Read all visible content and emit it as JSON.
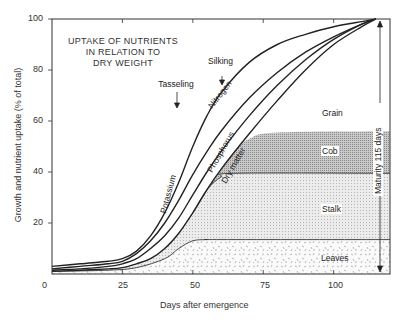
{
  "chart_data": {
    "type": "line",
    "title": "UPTAKE OF NUTRIENTS IN RELATION TO DRY WEIGHT",
    "title_lines": [
      "UPTAKE OF NUTRIENTS",
      "IN RELATION TO",
      "DRY WEIGHT"
    ],
    "xlabel": "Days after emergence",
    "ylabel": "Growth and nutrient uptake (% of total)",
    "xlim": [
      0,
      120
    ],
    "ylim": [
      0,
      100
    ],
    "x_ticks": [
      0,
      25,
      50,
      75,
      100
    ],
    "y_ticks": [
      20,
      40,
      60,
      80,
      100
    ],
    "grid": false,
    "series": [
      {
        "name": "Potassium",
        "x": [
          0,
          10,
          20,
          25,
          30,
          35,
          40,
          45,
          50,
          55,
          60,
          70,
          80,
          90,
          100,
          110,
          115
        ],
        "values": [
          3,
          4,
          5,
          6,
          9,
          15,
          24,
          36,
          50,
          62,
          71,
          83,
          90,
          94,
          97,
          99,
          100
        ]
      },
      {
        "name": "Nitrogen",
        "x": [
          0,
          10,
          20,
          25,
          30,
          35,
          40,
          45,
          50,
          55,
          60,
          70,
          80,
          90,
          100,
          110,
          115
        ],
        "values": [
          2,
          3,
          4,
          5,
          8,
          13,
          20,
          29,
          39,
          48,
          56,
          69,
          79,
          87,
          93,
          98,
          100
        ]
      },
      {
        "name": "Phosphorus",
        "x": [
          0,
          10,
          20,
          25,
          30,
          35,
          40,
          45,
          50,
          55,
          60,
          70,
          80,
          90,
          100,
          110,
          115
        ],
        "values": [
          1.5,
          2,
          3,
          4,
          6,
          10,
          15,
          22,
          31,
          40,
          48,
          62,
          74,
          84,
          92,
          98,
          100
        ]
      },
      {
        "name": "Dry matter",
        "x": [
          0,
          10,
          20,
          25,
          30,
          35,
          40,
          45,
          50,
          55,
          60,
          70,
          80,
          90,
          100,
          110,
          115
        ],
        "values": [
          1,
          1.5,
          2,
          2.5,
          4,
          6,
          10,
          16,
          24,
          33,
          41,
          55,
          68,
          80,
          90,
          97,
          100
        ]
      }
    ],
    "stacked_areas": [
      {
        "name": "Leaves",
        "x": [
          0,
          20,
          30,
          40,
          45,
          50,
          55,
          60,
          120
        ],
        "top": [
          1,
          1.5,
          2.5,
          6,
          10,
          13,
          13.5,
          13.5,
          13.5
        ]
      },
      {
        "name": "Stalk",
        "x": [
          0,
          20,
          30,
          40,
          45,
          50,
          55,
          60,
          65,
          120
        ],
        "top": [
          1,
          2,
          4,
          10,
          16,
          24,
          33,
          38,
          39.5,
          39.5
        ]
      },
      {
        "name": "Cob",
        "x": [
          50,
          55,
          60,
          65,
          70,
          80,
          120
        ],
        "top": [
          24,
          33,
          41,
          48,
          53,
          55.5,
          56
        ]
      },
      {
        "name": "Grain",
        "x": [
          60,
          120
        ],
        "top": [
          41,
          100
        ]
      }
    ],
    "annotations": [
      {
        "text": "Tasseling",
        "x": 50,
        "y": 76,
        "arrow_to": [
          55,
          66
        ]
      },
      {
        "text": "Silking",
        "x": 57,
        "y": 85,
        "arrow_to": [
          60,
          79
        ]
      },
      {
        "text": "Maturity 115 days",
        "x": 115,
        "y": 60,
        "vertical_arrow": [
          0,
          100
        ]
      }
    ],
    "region_labels": [
      "Grain",
      "Cob",
      "Stalk",
      "Leaves"
    ]
  },
  "labels": {
    "title_line1": "UPTAKE OF NUTRIENTS",
    "title_line2": "IN RELATION TO",
    "title_line3": "DRY WEIGHT",
    "xlabel": "Days after emergence",
    "ylabel": "Growth and nutrient uptake (% of total)",
    "x0": "0",
    "x25": "25",
    "x50": "50",
    "x75": "75",
    "x100": "100",
    "y20": "20",
    "y40": "40",
    "y60": "60",
    "y80": "80",
    "y100": "100",
    "potassium": "Potassium",
    "nitrogen": "Nitrogen",
    "phosphorus": "Phosphorus",
    "dry_matter": "Dry matter",
    "tasseling": "Tasseling",
    "silking": "Silking",
    "maturity": "Maturity 115 days",
    "grain": "Grain",
    "cob": "Cob",
    "stalk": "Stalk",
    "leaves": "Leaves"
  },
  "colors": {
    "line": "#222222",
    "cob_fill": "#b8b8b8",
    "stalk_fill": "#e2e2e2",
    "leaves_fill": "#f4f4f4"
  }
}
